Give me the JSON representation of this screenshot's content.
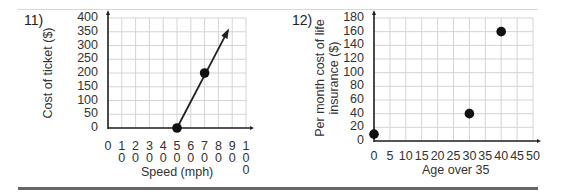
{
  "chart_data": [
    {
      "type": "line",
      "problem_number": "11)",
      "title": "",
      "xlabel": "Speed (mph)",
      "ylabel": "Cost of ticket ($)",
      "xlim": [
        0,
        100
      ],
      "ylim": [
        0,
        400
      ],
      "grid": true,
      "x_ticks": [
        "0",
        "10",
        "20",
        "30",
        "40",
        "50",
        "60",
        "70",
        "80",
        "90",
        "100"
      ],
      "y_ticks": [
        "0",
        "50",
        "100",
        "150",
        "200",
        "250",
        "300",
        "350",
        "400"
      ],
      "points": [
        {
          "x": 50,
          "y": 0
        },
        {
          "x": 70,
          "y": 200
        }
      ],
      "line": {
        "from": {
          "x": 50,
          "y": 0
        },
        "to": {
          "x": 87,
          "y": 355
        },
        "arrow_end": true
      }
    },
    {
      "type": "scatter",
      "problem_number": "12)",
      "title": "",
      "xlabel": "Age over 35",
      "ylabel": "Per month cost of life insurance ($)",
      "ylabel_lines": [
        "Per month cost of life",
        "insurance ($)"
      ],
      "xlim": [
        0,
        50
      ],
      "ylim": [
        0,
        180
      ],
      "grid": true,
      "x_ticks": [
        "0",
        "5",
        "10",
        "15",
        "20",
        "25",
        "30",
        "35",
        "40",
        "45",
        "50"
      ],
      "y_ticks": [
        "0",
        "20",
        "40",
        "60",
        "80",
        "100",
        "120",
        "140",
        "160",
        "180"
      ],
      "points": [
        {
          "x": 0,
          "y": 10
        },
        {
          "x": 30,
          "y": 40
        },
        {
          "x": 40,
          "y": 160
        }
      ]
    }
  ],
  "colors": {
    "grid": "#d4d4d4",
    "axis": "#222222",
    "point": "#111111",
    "rule": "#666666"
  }
}
